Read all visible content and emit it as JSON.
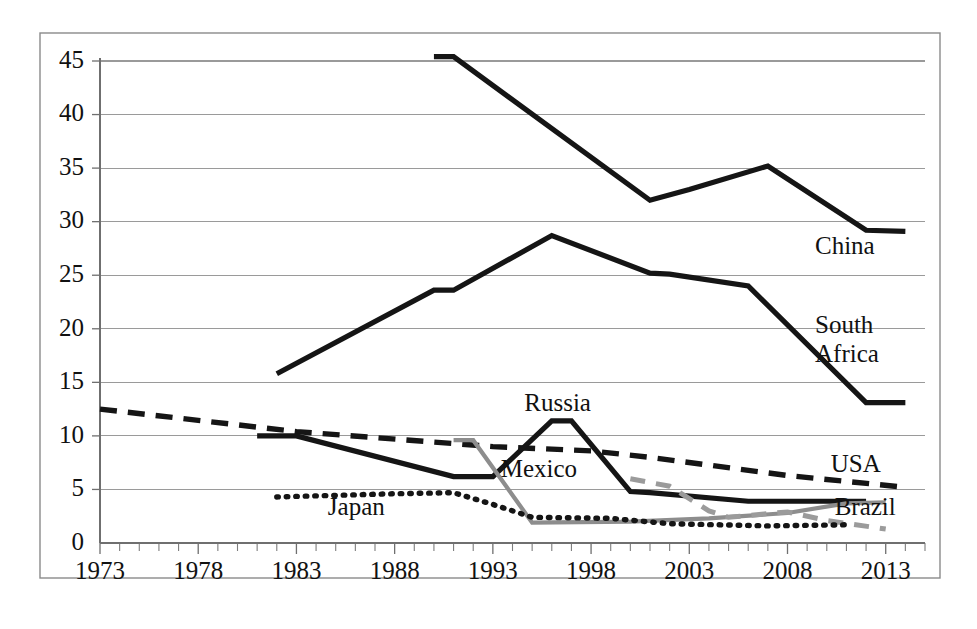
{
  "chart_data": {
    "type": "line",
    "title": "",
    "xlabel": "",
    "ylabel": "",
    "xlim": [
      1973,
      2015
    ],
    "ylim": [
      0,
      46
    ],
    "ytick_labels": [
      "0",
      "5",
      "10",
      "15",
      "20",
      "25",
      "30",
      "35",
      "40",
      "45"
    ],
    "yticks": [
      0,
      5,
      10,
      15,
      20,
      25,
      30,
      35,
      40,
      45
    ],
    "xtick_labels": [
      "1973",
      "1978",
      "1983",
      "1988",
      "1993",
      "1998",
      "2003",
      "2008",
      "2013"
    ],
    "xticks": [
      1973,
      1978,
      1983,
      1988,
      1993,
      1998,
      2003,
      2008,
      2013
    ],
    "minor_xtick_step": 1,
    "grid": "horizontal",
    "legend": "inline-right-labels",
    "series": [
      {
        "name": "China",
        "label": "China",
        "style": "solid-black",
        "label_x": 2009.4,
        "label_y": 27.0,
        "points": [
          {
            "x": 1990,
            "y": 45.4
          },
          {
            "x": 1991,
            "y": 45.4
          },
          {
            "x": 2001,
            "y": 32.0
          },
          {
            "x": 2003,
            "y": 33.0
          },
          {
            "x": 2007,
            "y": 35.2
          },
          {
            "x": 2012,
            "y": 29.2
          },
          {
            "x": 2014,
            "y": 29.1
          }
        ]
      },
      {
        "name": "South Africa",
        "label": "South Africa",
        "style": "solid-black",
        "label_x": 2009.4,
        "label_y": 19.6,
        "points": [
          {
            "x": 1982,
            "y": 15.8
          },
          {
            "x": 1990,
            "y": 23.6
          },
          {
            "x": 1991,
            "y": 23.6
          },
          {
            "x": 1996,
            "y": 28.7
          },
          {
            "x": 2001,
            "y": 25.2
          },
          {
            "x": 2002,
            "y": 25.1
          },
          {
            "x": 2006,
            "y": 24.0
          },
          {
            "x": 2012,
            "y": 13.1
          },
          {
            "x": 2014,
            "y": 13.1
          }
        ]
      },
      {
        "name": "USA",
        "label": "USA",
        "style": "dashed-black",
        "label_x": 2010.2,
        "label_y": 6.6,
        "points": [
          {
            "x": 1973,
            "y": 12.5
          },
          {
            "x": 1983,
            "y": 10.4
          },
          {
            "x": 1993,
            "y": 9.0
          },
          {
            "x": 1998,
            "y": 8.6
          },
          {
            "x": 2001,
            "y": 8.0
          },
          {
            "x": 2008,
            "y": 6.3
          },
          {
            "x": 2014,
            "y": 5.2
          }
        ]
      },
      {
        "name": "Russia",
        "label": "Russia",
        "style": "solid-black",
        "label_x": 1994.6,
        "label_y": 12.3,
        "points": [
          {
            "x": 1981,
            "y": 10.0
          },
          {
            "x": 1983,
            "y": 10.0
          },
          {
            "x": 1991,
            "y": 6.2
          },
          {
            "x": 1993,
            "y": 6.2
          },
          {
            "x": 1996,
            "y": 11.4
          },
          {
            "x": 1997,
            "y": 11.4
          },
          {
            "x": 2000,
            "y": 4.8
          },
          {
            "x": 2001,
            "y": 4.7
          },
          {
            "x": 2006,
            "y": 3.9
          },
          {
            "x": 2012,
            "y": 3.9
          }
        ]
      },
      {
        "name": "Mexico",
        "label": "Mexico",
        "style": "solid-gray",
        "label_x": 1993.4,
        "label_y": 6.2,
        "points": [
          {
            "x": 1991,
            "y": 9.6
          },
          {
            "x": 1992,
            "y": 9.6
          },
          {
            "x": 1995,
            "y": 1.9
          },
          {
            "x": 2000,
            "y": 2.0
          },
          {
            "x": 2004,
            "y": 2.3
          },
          {
            "x": 2008,
            "y": 2.8
          },
          {
            "x": 2011,
            "y": 3.7
          },
          {
            "x": 2013,
            "y": 3.8
          }
        ]
      },
      {
        "name": "Brazil",
        "label": "Brazil",
        "style": "dashed-gray",
        "label_x": 2010.4,
        "label_y": 2.6,
        "points": [
          {
            "x": 2000,
            "y": 6.0
          },
          {
            "x": 2002,
            "y": 5.3
          },
          {
            "x": 2004,
            "y": 3.0
          },
          {
            "x": 2005,
            "y": 2.4
          },
          {
            "x": 2008,
            "y": 2.9
          },
          {
            "x": 2010,
            "y": 2.1
          },
          {
            "x": 2013,
            "y": 1.3
          }
        ]
      },
      {
        "name": "Japan",
        "label": "Japan",
        "style": "dotted-black",
        "label_x": 1984.6,
        "label_y": 2.6,
        "points": [
          {
            "x": 1982,
            "y": 4.3
          },
          {
            "x": 1988,
            "y": 4.6
          },
          {
            "x": 1991,
            "y": 4.7
          },
          {
            "x": 1993,
            "y": 3.6
          },
          {
            "x": 1995,
            "y": 2.4
          },
          {
            "x": 1999,
            "y": 2.3
          },
          {
            "x": 2002,
            "y": 1.8
          },
          {
            "x": 2007,
            "y": 1.6
          },
          {
            "x": 2011,
            "y": 1.7
          }
        ]
      }
    ]
  }
}
